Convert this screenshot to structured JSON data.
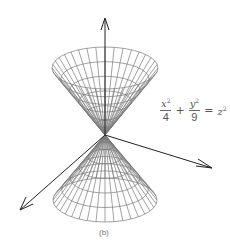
{
  "figure": {
    "label": "(b)",
    "equation": {
      "term1_num": "x",
      "term1_num_exp": "2",
      "term1_den": "4",
      "plus": "+",
      "term2_num": "y",
      "term2_num_exp": "2",
      "term2_den": "9",
      "equals": "=",
      "rhs": "z",
      "rhs_exp": "2"
    },
    "colors": {
      "mesh": "#777777",
      "axis": "#222222",
      "text": "#555555",
      "background": "#ffffff"
    },
    "axes": [
      "z-axis (up)",
      "x-axis (lower-left)",
      "y-axis (right)"
    ]
  }
}
